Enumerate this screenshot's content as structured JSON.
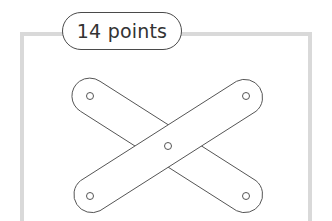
{
  "label": {
    "text": "14 points"
  },
  "figure": {
    "stroke_color": "#555555",
    "frame_color": "#d9d9d9",
    "holes": [
      {
        "name": "top-left",
        "cx": 90,
        "cy": 96
      },
      {
        "name": "top-right",
        "cx": 246,
        "cy": 96
      },
      {
        "name": "center",
        "cx": 168,
        "cy": 146
      },
      {
        "name": "bottom-left",
        "cx": 90,
        "cy": 196
      },
      {
        "name": "bottom-right",
        "cx": 246,
        "cy": 196
      }
    ]
  }
}
